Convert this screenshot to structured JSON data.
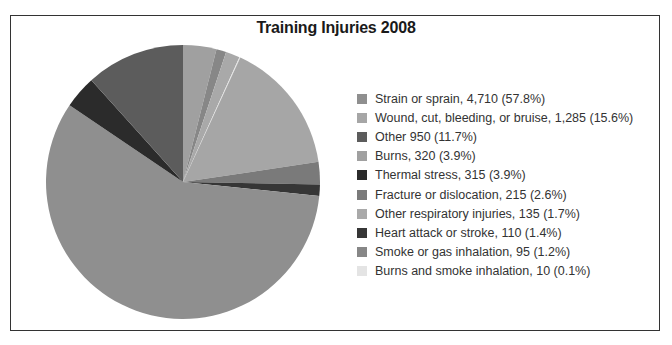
{
  "chart_data": {
    "type": "pie",
    "title": "Training Injuries 2008",
    "legend_position": "right",
    "slices": [
      {
        "label": "Strain or sprain",
        "value": 4710,
        "percent": 57.8,
        "color": "#8f8f8f",
        "legend_text": "Strain or sprain, 4,710 (57.8%)"
      },
      {
        "label": "Wound, cut, bleeding, or bruise",
        "value": 1285,
        "percent": 15.6,
        "color": "#a6a6a6",
        "legend_text": "Wound, cut, bleeding, or bruise, 1,285 (15.6%)"
      },
      {
        "label": "Other",
        "value": 950,
        "percent": 11.7,
        "color": "#5c5c5c",
        "legend_text": "Other 950 (11.7%)"
      },
      {
        "label": "Burns",
        "value": 320,
        "percent": 3.9,
        "color": "#a0a0a0",
        "legend_text": "Burns, 320 (3.9%)"
      },
      {
        "label": "Thermal stress",
        "value": 315,
        "percent": 3.9,
        "color": "#2b2b2b",
        "legend_text": "Thermal stress, 315 (3.9%)"
      },
      {
        "label": "Fracture or dislocation",
        "value": 215,
        "percent": 2.6,
        "color": "#7a7a7a",
        "legend_text": "Fracture or dislocation, 215 (2.6%)"
      },
      {
        "label": "Other respiratory injuries",
        "value": 135,
        "percent": 1.7,
        "color": "#a9a9a9",
        "legend_text": "Other respiratory injuries, 135 (1.7%)"
      },
      {
        "label": "Heart attack or stroke",
        "value": 110,
        "percent": 1.4,
        "color": "#363636",
        "legend_text": "Heart attack or stroke, 110 (1.4%)"
      },
      {
        "label": "Smoke or gas inhalation",
        "value": 95,
        "percent": 1.2,
        "color": "#878787",
        "legend_text": "Smoke or gas inhalation, 95 (1.2%)"
      },
      {
        "label": "Burns and smoke inhalation",
        "value": 10,
        "percent": 0.1,
        "color": "#e4e4e4",
        "legend_text": "Burns and smoke inhalation, 10 (0.1%)"
      }
    ],
    "draw_order_clockwise_from_top": [
      3,
      8,
      6,
      9,
      1,
      5,
      7,
      0,
      4,
      2
    ]
  }
}
